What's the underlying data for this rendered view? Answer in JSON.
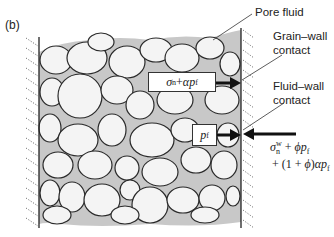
{
  "figure": {
    "panel_label": "(b)",
    "labels": {
      "pore_fluid": "Pore fluid",
      "grain_wall_contact_line1": "Grain–wall",
      "grain_wall_contact_line2": "contact",
      "fluid_wall_contact_line1": "Fluid–wall",
      "fluid_wall_contact_line2": "contact"
    },
    "boxes": {
      "grain_stress": {
        "sigma": "σ",
        "sub_n": "n",
        "plus": " + ",
        "alpha": "α",
        "p": "p",
        "sub_f": "f"
      },
      "fluid_pressure": {
        "p": "p",
        "sub_f": "f"
      }
    },
    "wall_reaction": {
      "line1": {
        "sigma": "σ",
        "sup_w": "w",
        "sub_n": "n",
        "plus": " + ",
        "phi": "ϕ",
        "p": "p",
        "sub_f": "f"
      },
      "line2": {
        "prefix": "+ (1 + ",
        "phi": "ϕ",
        "mid": ")",
        "alpha": "α",
        "p": "p",
        "sub_f": "f"
      }
    },
    "colors": {
      "grain_fill": "#f4f4f4",
      "pore_fluid_fill": "#c8c8c8",
      "outline": "#2a2a2a"
    }
  }
}
